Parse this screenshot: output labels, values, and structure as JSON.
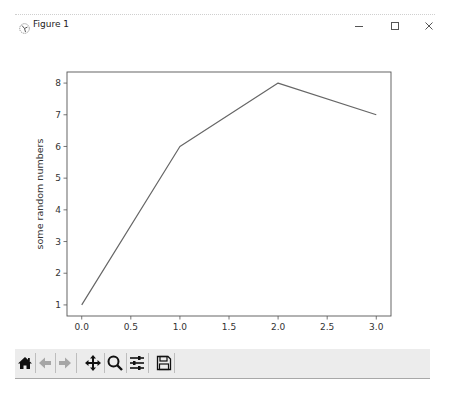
{
  "window": {
    "title": "Figure 1",
    "icons": {
      "app": "matplotlib-logo-icon",
      "minimize": "minimize-icon",
      "maximize": "maximize-icon",
      "close": "close-icon"
    }
  },
  "toolbar": {
    "buttons": [
      {
        "name": "home",
        "icon": "home-icon"
      },
      {
        "name": "back",
        "icon": "arrow-left-icon"
      },
      {
        "name": "forward",
        "icon": "arrow-right-icon"
      },
      {
        "name": "pan",
        "icon": "move-arrows-icon"
      },
      {
        "name": "zoom",
        "icon": "magnifier-icon"
      },
      {
        "name": "configure-subplots",
        "icon": "sliders-icon"
      },
      {
        "name": "save",
        "icon": "floppy-disk-icon"
      }
    ]
  },
  "chart_data": {
    "type": "line",
    "title": "",
    "xlabel": "",
    "ylabel": "some random numbers",
    "x": [
      0,
      1,
      2,
      3
    ],
    "series": [
      {
        "name": "",
        "values": [
          1,
          6,
          8,
          7
        ],
        "color": "#666666"
      }
    ],
    "xticks": [
      "0.0",
      "0.5",
      "1.0",
      "1.5",
      "2.0",
      "2.5",
      "3.0"
    ],
    "yticks": [
      "1",
      "2",
      "3",
      "4",
      "5",
      "6",
      "7",
      "8"
    ],
    "xlim": [
      -0.15,
      3.15
    ],
    "ylim": [
      0.65,
      8.35
    ],
    "grid": false,
    "legend": null
  }
}
